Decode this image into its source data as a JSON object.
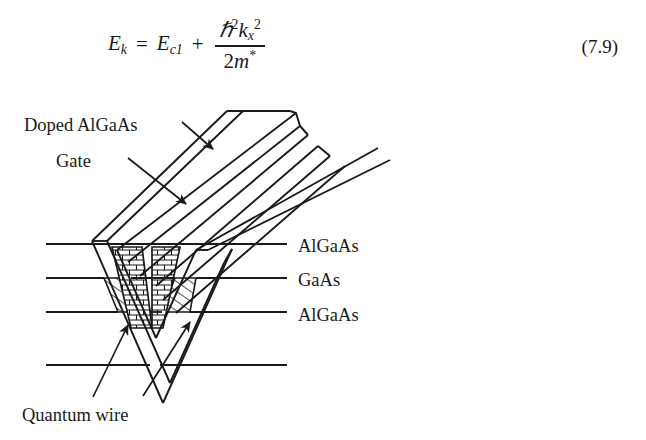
{
  "page": {
    "background_color": "#ffffff",
    "ink_color": "#1a1a1a"
  },
  "equation": {
    "number": "(7.9)",
    "lhs_var": "E",
    "lhs_sub": "k",
    "equals": "=",
    "term1_var": "E",
    "term1_sub": "c1",
    "plus": "+",
    "numerator_hbar": "ℏ",
    "numerator_hbar_sup": "2",
    "numerator_k": "k",
    "numerator_k_sub": "x",
    "numerator_k_sup": "2",
    "denominator_two": "2",
    "denominator_m": "m",
    "denominator_star": "*",
    "plain_text": "E_k = E_c1 + (ℏ² k_x²) / (2m*)"
  },
  "figure": {
    "caption_labels": {
      "doped_algaas": "Doped AlGaAs",
      "gate": "Gate",
      "layer_top": "AlGaAs",
      "layer_middle": "GaAs",
      "layer_bottom": "AlGaAs",
      "quantum_wire": "Quantum wire"
    },
    "hatch_styles": {
      "brick": "brick-hatch",
      "diagonal": "diagonal-hatch"
    },
    "layer_line_y": [
      144,
      178,
      212,
      265
    ],
    "annotations": [
      {
        "name": "arrow-doped-algaas",
        "points_to": "upper diagonal band"
      },
      {
        "name": "arrow-gate",
        "points_to": "lower diagonal band"
      },
      {
        "name": "arrow-quantum-wire-left",
        "points_to": "left V-groove corner"
      },
      {
        "name": "arrow-quantum-wire-right",
        "points_to": "right V-groove corner"
      }
    ]
  }
}
